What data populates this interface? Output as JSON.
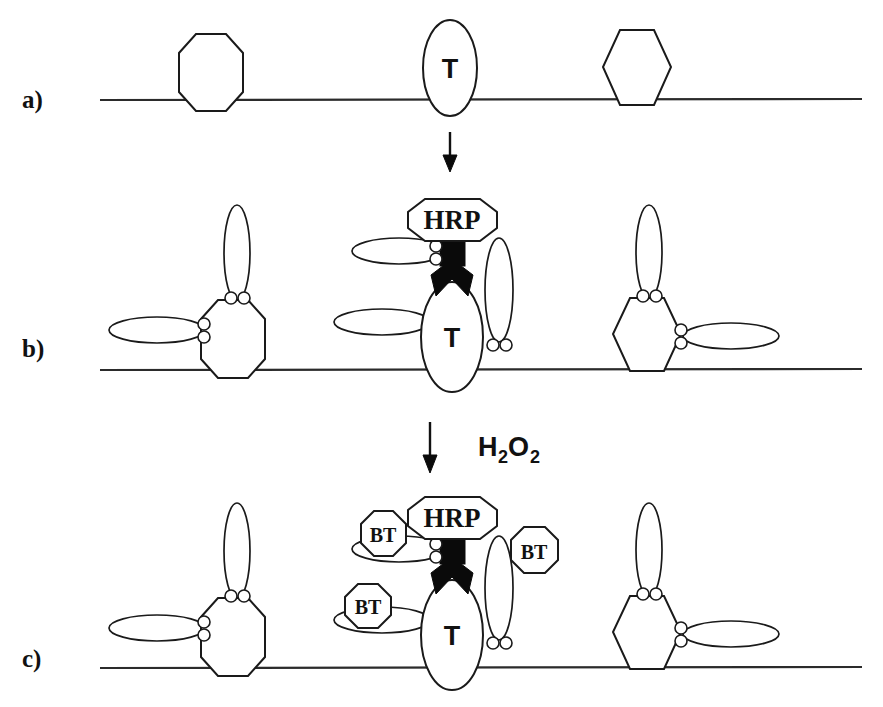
{
  "figure": {
    "background_color": "#ffffff",
    "line_color": "#1a1a1a",
    "fill_color": "#ffffff",
    "black_marker_color": "#0a0a0a",
    "panels": [
      {
        "id": "a",
        "label": "a)",
        "description": "Bare membrane with three embedded surface proteins",
        "membrane_y": 100,
        "elements": [
          {
            "name": "elongated-octagon-protein",
            "shape": "octagon-tall",
            "label": ""
          },
          {
            "name": "target-analyte-ellipse",
            "shape": "ellipse-vertical",
            "label": "T"
          },
          {
            "name": "hexagon-protein",
            "shape": "hexagon",
            "label": ""
          }
        ]
      },
      {
        "id": "b",
        "label": "b)",
        "description": "Antibodies bound to surface proteins; HRP-labelled antibody on target T",
        "membrane_y": 370,
        "elements": [
          {
            "name": "elongated-octagon-protein",
            "shape": "octagon-tall",
            "label": ""
          },
          {
            "name": "target-analyte-ellipse",
            "shape": "ellipse-vertical",
            "label": "T"
          },
          {
            "name": "hexagon-protein",
            "shape": "hexagon",
            "label": ""
          },
          {
            "name": "hrp-enzyme-label",
            "shape": "octagon",
            "label": "HRP"
          }
        ]
      },
      {
        "id": "c",
        "label": "c)",
        "description": "After H2O2 addition, BT product deposits near the HRP label",
        "membrane_y": 668,
        "elements": [
          {
            "name": "elongated-octagon-protein",
            "shape": "octagon-tall",
            "label": ""
          },
          {
            "name": "target-analyte-ellipse",
            "shape": "ellipse-vertical",
            "label": "T"
          },
          {
            "name": "hexagon-protein",
            "shape": "hexagon",
            "label": ""
          },
          {
            "name": "hrp-enzyme-label",
            "shape": "octagon",
            "label": "HRP"
          },
          {
            "name": "bt-deposit-label",
            "shape": "octagon",
            "label": "BT"
          },
          {
            "name": "bt-deposit-label",
            "shape": "octagon",
            "label": "BT"
          },
          {
            "name": "bt-deposit-label",
            "shape": "octagon",
            "label": "BT"
          }
        ]
      }
    ],
    "labels": {
      "panel_a": "a)",
      "panel_b": "b)",
      "panel_c": "c)",
      "target": "T",
      "enzyme": "HRP",
      "product": "BT",
      "reagent_formula": "H2O2",
      "reagent_main_1": "H",
      "reagent_sub_1": "2",
      "reagent_main_2": "O",
      "reagent_sub_2": "2"
    },
    "arrows": [
      {
        "name": "arrow-a-to-b",
        "direction": "down",
        "annotation": ""
      },
      {
        "name": "arrow-b-to-c",
        "direction": "down",
        "annotation": "H2O2"
      }
    ]
  }
}
